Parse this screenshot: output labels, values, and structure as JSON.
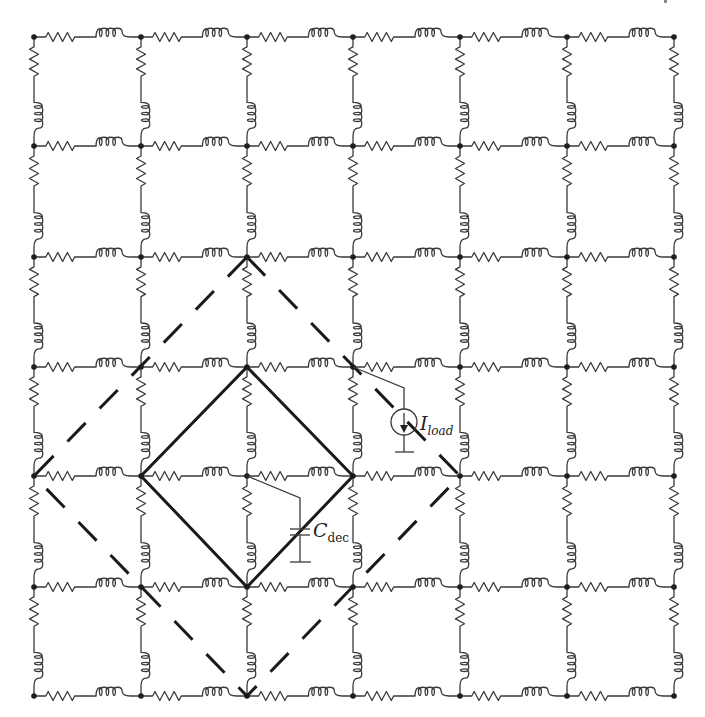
{
  "figure": {
    "type": "power delivery network RL mesh grid",
    "grid": {
      "columns": 7,
      "rows": 7,
      "x": [
        34,
        141,
        247,
        353,
        460,
        567,
        674
      ],
      "y": [
        37,
        146,
        257,
        367,
        476,
        587,
        696
      ],
      "edge_components": [
        "resistor",
        "inductor"
      ]
    },
    "inner_diamond": {
      "style": "solid",
      "vertices": [
        [
          247,
          367
        ],
        [
          353,
          476
        ],
        [
          247,
          587
        ],
        [
          141,
          476
        ]
      ]
    },
    "outer_diamond": {
      "style": "dashed",
      "vertices": [
        [
          247,
          257
        ],
        [
          460,
          476
        ],
        [
          247,
          696
        ],
        [
          34,
          476
        ]
      ]
    },
    "current_source": {
      "label_main": "I",
      "label_sub": "load",
      "attach_node": [
        353,
        367
      ]
    },
    "decap": {
      "label_main": "C",
      "label_sub": "dec",
      "attach_node": [
        247,
        476
      ]
    },
    "colors": {
      "wire": "#3a3a3a",
      "diamond": "#1a1a1a",
      "background": "#ffffff"
    }
  }
}
